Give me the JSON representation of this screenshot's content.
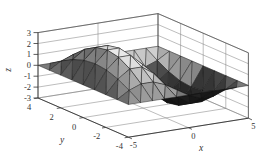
{
  "figure": {
    "background": "#ffffff"
  },
  "colors": {
    "background": "#ffffff",
    "axis_line": "#333333",
    "box_edge": "#4a4a4a",
    "grid_line": "#7a7a7a",
    "mesh_edge": "#141414",
    "label_text": "#333333",
    "surface_min": "#000000",
    "surface_max": "#e8e8e8"
  },
  "chart_data": {
    "type": "surface",
    "title": "",
    "xlabel": "x",
    "ylabel": "y",
    "zlabel": "z",
    "xlim": [
      -5,
      5
    ],
    "ylim": [
      -4,
      4
    ],
    "zlim": [
      -3,
      3
    ],
    "grid": true,
    "colormap": "gray",
    "x_tick_values": [
      -5,
      0,
      5
    ],
    "x_tick_labels": [
      "-5",
      "0",
      "5"
    ],
    "y_tick_values": [
      4,
      2,
      0,
      -2,
      -4
    ],
    "y_tick_labels": [
      "4",
      "2",
      "0",
      "-2",
      "-4"
    ],
    "z_tick_values": [
      3,
      2,
      1,
      0,
      -1,
      -2,
      -3
    ],
    "z_tick_labels": [
      "3",
      "2",
      "1",
      "0",
      "-1",
      "-2",
      "-3"
    ],
    "x_values": [
      -5,
      -4,
      -3,
      -2,
      -1,
      0,
      1,
      2,
      3,
      4,
      5
    ],
    "y_values": [
      -4,
      -3,
      -2,
      -1,
      0,
      1,
      2,
      3,
      4
    ],
    "z_matrix": [
      [
        0,
        0,
        0,
        0,
        0,
        0,
        0,
        0,
        0,
        0,
        0
      ],
      [
        0,
        0.67,
        1.09,
        1.09,
        0.67,
        0,
        -0.67,
        -1.09,
        -1.09,
        -0.67,
        0
      ],
      [
        0,
        1.25,
        2.02,
        2.02,
        1.25,
        0,
        -1.25,
        -2.02,
        -2.02,
        -1.25,
        0
      ],
      [
        0,
        1.63,
        2.64,
        2.64,
        1.63,
        0,
        -1.63,
        -2.64,
        -2.64,
        -1.63,
        0
      ],
      [
        0,
        1.76,
        2.85,
        2.85,
        1.76,
        0,
        -1.76,
        -2.85,
        -2.85,
        -1.76,
        0
      ],
      [
        0,
        1.63,
        2.64,
        2.64,
        1.63,
        0,
        -1.63,
        -2.64,
        -2.64,
        -1.63,
        0
      ],
      [
        0,
        1.25,
        2.02,
        2.02,
        1.25,
        0,
        -1.25,
        -2.02,
        -2.02,
        -1.25,
        0
      ],
      [
        0,
        0.67,
        1.09,
        1.09,
        0.67,
        0,
        -0.67,
        -1.09,
        -1.09,
        -0.67,
        0
      ],
      [
        0,
        0,
        0,
        0,
        0,
        0,
        0,
        0,
        0,
        0,
        0
      ]
    ]
  }
}
